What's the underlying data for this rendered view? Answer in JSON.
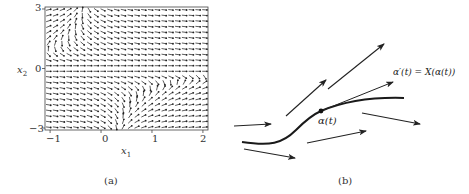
{
  "chart_data": [
    {
      "type": "quiver",
      "panel": "(a)",
      "title": "",
      "xlabel": "x1",
      "ylabel": "x2",
      "xlim": [
        -1.1,
        2.1
      ],
      "ylim": [
        -3.1,
        3.1
      ],
      "xticks": [
        -1,
        0,
        1,
        2
      ],
      "yticks": [
        -3,
        0,
        3
      ],
      "grid": false,
      "legend": null,
      "field_description": "Direction field: arrows mostly horizontal/down-right; near-vertical arrows near (x1≈-1, 0<x2<1.5) and (1<x1<2, -2<x2<-0.3); horizontal along x2=0.",
      "grid_samples": {
        "nx": 24,
        "ny": 22
      },
      "field_model": {
        "dx": "1 + x1*x2",
        "dy": "-0.5"
      }
    }
  ],
  "panel_a": {
    "y_ticks": [
      "3",
      "0",
      "−3"
    ],
    "x_ticks": [
      "−1",
      "0",
      "1",
      "2"
    ],
    "xlabel": "x",
    "xlabel_sub": "1",
    "ylabel": "x",
    "ylabel_sub": "2",
    "caption": "(a)"
  },
  "panel_b": {
    "point_label": "α(t)",
    "tangent_label": "α′(t) = X(α(t))",
    "caption": "(b)",
    "arrows": [
      {
        "x1": 4,
        "y1": 126,
        "x2": 41,
        "y2": 124
      },
      {
        "x1": 56,
        "y1": 116,
        "x2": 96,
        "y2": 80
      },
      {
        "x1": 98,
        "y1": 89,
        "x2": 154,
        "y2": 44
      },
      {
        "x1": 132,
        "y1": 113,
        "x2": 190,
        "y2": 124
      },
      {
        "x1": 77,
        "y1": 143,
        "x2": 136,
        "y2": 131
      },
      {
        "x1": 14,
        "y1": 149,
        "x2": 65,
        "y2": 158
      }
    ],
    "tangent": {
      "x1": 91,
      "y1": 111,
      "x2": 163,
      "y2": 82
    },
    "curve_path": "M12,142 C40,146 52,144 66,130 C78,118 84,114 91,111 C115,101 140,97 174,98",
    "point": {
      "x": 91,
      "y": 111
    }
  }
}
